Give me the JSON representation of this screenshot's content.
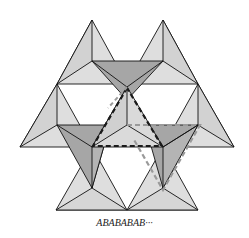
{
  "caption": "ABABABAB···",
  "colors": {
    "light_face": "#dedede",
    "dark_face": "#a6a6a6",
    "mid_face": "#cfcfcf",
    "edge": "#111111",
    "dashed_black": "#1a1a1a",
    "dashed_gray": "#9a9a9a",
    "background": "#ffffff"
  },
  "diagram": {
    "highlight_black_dashed": "central upward tetrahedron",
    "highlight_gray_dashed": "downward tetrahedron to the right"
  }
}
